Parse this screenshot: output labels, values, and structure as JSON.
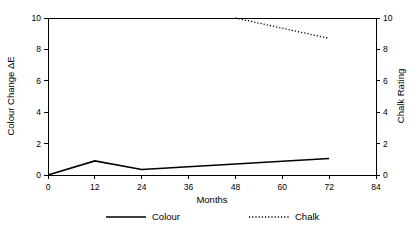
{
  "chart_data": {
    "type": "line",
    "title": "",
    "xlabel": "Months",
    "ylabel": "Colour Change ΔE",
    "y2label": "Chalk Rating",
    "xlim": [
      0,
      84
    ],
    "ylim": [
      0,
      10
    ],
    "y2lim": [
      0,
      10
    ],
    "xticks": [
      0,
      12,
      24,
      36,
      48,
      60,
      72,
      84
    ],
    "xtick_labels": [
      "0",
      "12",
      "24",
      "36",
      "48",
      "60",
      "72",
      "84"
    ],
    "yticks": [
      0,
      2,
      4,
      6,
      8,
      10
    ],
    "ytick_labels": [
      "0",
      "2",
      "4",
      "6",
      "8",
      "10"
    ],
    "y2ticks": [
      0,
      2,
      4,
      6,
      8,
      10
    ],
    "y2tick_labels": [
      "0",
      "2",
      "4",
      "6",
      "8",
      "10"
    ],
    "grid": false,
    "legend_position": "bottom",
    "series": [
      {
        "name": "Colour",
        "axis": "left",
        "style": "solid",
        "color": "#000000",
        "x": [
          0,
          12,
          24,
          72
        ],
        "values": [
          0.0,
          0.9,
          0.35,
          1.05
        ]
      },
      {
        "name": "Chalk",
        "axis": "right",
        "style": "dotted",
        "color": "#000000",
        "x": [
          48,
          72
        ],
        "values": [
          10.0,
          8.7
        ]
      }
    ]
  },
  "legend": {
    "items": [
      {
        "label": "Colour",
        "style": "solid"
      },
      {
        "label": "Chalk",
        "style": "dotted"
      }
    ]
  }
}
